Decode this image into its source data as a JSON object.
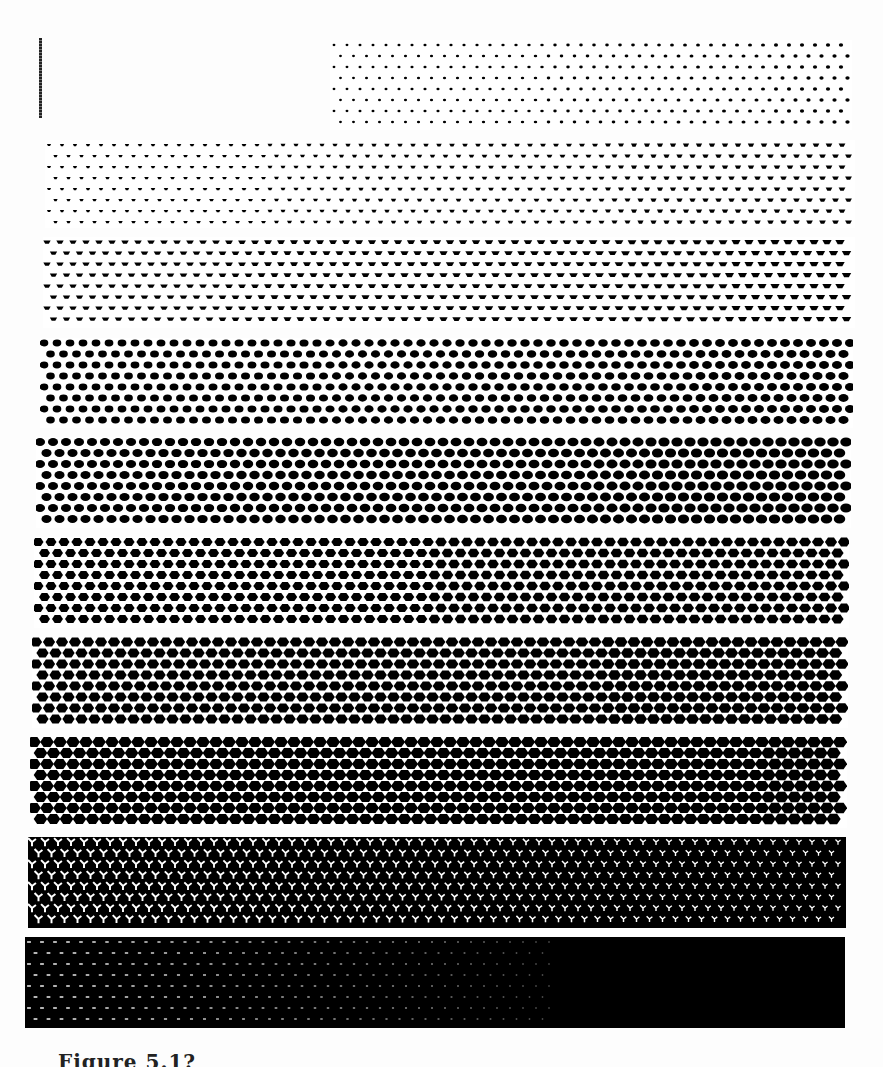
{
  "figure": {
    "caption": "Figure 5.1? ",
    "ink_color": "#000000",
    "paper_color": "#ffffff"
  },
  "top_mark": {
    "type": "vertical-dotted-line"
  },
  "strips": [
    {
      "index": 0,
      "label": "partial",
      "x": 330,
      "y": 40,
      "w": 522,
      "h": 90,
      "dot_min": 1.2,
      "dot_max": 1.8,
      "invert": false,
      "shape": "dot"
    },
    {
      "index": 1,
      "x": 45,
      "y": 140,
      "w": 810,
      "h": 88,
      "dot_min": 1.6,
      "dot_max": 2.6,
      "invert": false,
      "shape": "triangle"
    },
    {
      "index": 2,
      "x": 43,
      "y": 237,
      "w": 812,
      "h": 91,
      "dot_min": 2.8,
      "dot_max": 3.6,
      "invert": false,
      "shape": "cup"
    },
    {
      "index": 3,
      "x": 40,
      "y": 338,
      "w": 813,
      "h": 90,
      "dot_min": 3.6,
      "dot_max": 4.2,
      "invert": false,
      "shape": "blob"
    },
    {
      "index": 4,
      "x": 36,
      "y": 437,
      "w": 815,
      "h": 91,
      "dot_min": 4.2,
      "dot_max": 4.8,
      "invert": false,
      "shape": "blob"
    },
    {
      "index": 5,
      "x": 34,
      "y": 537,
      "w": 815,
      "h": 91,
      "dot_min": 4.8,
      "dot_max": 5.3,
      "invert": false,
      "shape": "hex"
    },
    {
      "index": 6,
      "x": 32,
      "y": 637,
      "w": 816,
      "h": 91,
      "dot_min": 5.3,
      "dot_max": 5.8,
      "invert": false,
      "shape": "hex"
    },
    {
      "index": 7,
      "x": 30,
      "y": 737,
      "w": 817,
      "h": 91,
      "dot_min": 5.9,
      "dot_max": 6.3,
      "invert": false,
      "shape": "hex"
    },
    {
      "index": 8,
      "x": 28,
      "y": 837,
      "w": 818,
      "h": 91,
      "dot_min": 2.2,
      "dot_max": 1.4,
      "invert": true,
      "shape": "y-shape"
    },
    {
      "index": 9,
      "x": 25,
      "y": 937,
      "w": 820,
      "h": 91,
      "dot_min": 1.2,
      "dot_max": 0.0,
      "invert": true,
      "shape": "dash",
      "solid_from_fraction": 0.64
    }
  ]
}
